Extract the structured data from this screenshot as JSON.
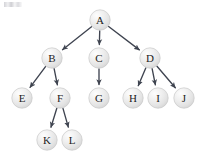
{
  "figure": {
    "background_color": "#ffffff",
    "width": 207,
    "height": 164
  },
  "chart_data": {
    "type": "diagram",
    "subtype": "directed-tree",
    "title": "",
    "root": "A",
    "node_radius": 10.2,
    "node_fill_color": "#e8e8e8",
    "node_highlight_color": "#fcfcfc",
    "node_stroke_color": "#c9c9c9",
    "edge_color": "#3f4450",
    "label_color": "#1c1c22",
    "directed": true,
    "arrowhead": true,
    "levels": [
      [
        "A"
      ],
      [
        "B",
        "C",
        "D"
      ],
      [
        "E",
        "F",
        "G",
        "H",
        "I",
        "J"
      ],
      [
        "K",
        "L"
      ]
    ],
    "nodes": [
      {
        "id": "A",
        "label": "A",
        "x": 100,
        "y": 20,
        "level": 0
      },
      {
        "id": "B",
        "label": "B",
        "x": 52,
        "y": 58,
        "level": 1
      },
      {
        "id": "C",
        "label": "C",
        "x": 99,
        "y": 58,
        "level": 1
      },
      {
        "id": "D",
        "label": "D",
        "x": 150,
        "y": 58,
        "level": 1
      },
      {
        "id": "E",
        "label": "E",
        "x": 22,
        "y": 98,
        "level": 2
      },
      {
        "id": "F",
        "label": "F",
        "x": 60,
        "y": 98,
        "level": 2
      },
      {
        "id": "G",
        "label": "G",
        "x": 99,
        "y": 98,
        "level": 2
      },
      {
        "id": "H",
        "label": "H",
        "x": 133,
        "y": 98,
        "level": 2
      },
      {
        "id": "I",
        "label": "I",
        "x": 158,
        "y": 98,
        "level": 2
      },
      {
        "id": "J",
        "label": "J",
        "x": 184,
        "y": 98,
        "level": 2
      },
      {
        "id": "K",
        "label": "K",
        "x": 47,
        "y": 140,
        "level": 3
      },
      {
        "id": "L",
        "label": "L",
        "x": 72,
        "y": 140,
        "level": 3
      }
    ],
    "edges": [
      {
        "from": "A",
        "to": "B"
      },
      {
        "from": "A",
        "to": "C"
      },
      {
        "from": "A",
        "to": "D"
      },
      {
        "from": "B",
        "to": "E"
      },
      {
        "from": "B",
        "to": "F"
      },
      {
        "from": "C",
        "to": "G"
      },
      {
        "from": "D",
        "to": "H"
      },
      {
        "from": "D",
        "to": "I"
      },
      {
        "from": "D",
        "to": "J"
      },
      {
        "from": "F",
        "to": "K"
      },
      {
        "from": "F",
        "to": "L"
      }
    ]
  }
}
